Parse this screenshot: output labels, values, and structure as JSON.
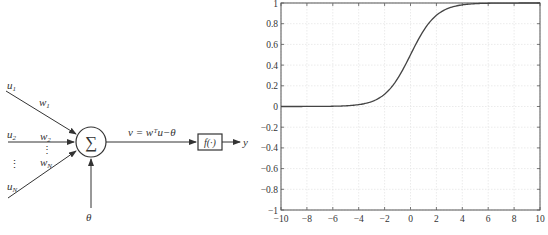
{
  "neuron": {
    "inputs": [
      {
        "label": "u",
        "sub": "1",
        "weight": "w",
        "wsub": "1"
      },
      {
        "label": "u",
        "sub": "2",
        "weight": "w",
        "wsub": "2"
      },
      {
        "label": "u",
        "sub": "N",
        "weight": "w",
        "wsub": "N"
      }
    ],
    "ellipsis": "⋮",
    "sum_symbol": "∑",
    "equation": "v = wᵀu−θ",
    "activation": "f(·)",
    "output": "y",
    "bias": "θ"
  },
  "chart_data": {
    "type": "line",
    "title": "",
    "xlabel": "",
    "ylabel": "",
    "xlim": [
      -10,
      10
    ],
    "ylim": [
      -1,
      1
    ],
    "grid": true,
    "x_ticks": [
      "−10",
      "−8",
      "−6",
      "−4",
      "−2",
      "0",
      "2",
      "4",
      "6",
      "8",
      "10"
    ],
    "y_ticks": [
      "1",
      "0.8",
      "0.6",
      "0.4",
      "0.2",
      "0",
      "−0.2",
      "−0.4",
      "−0.6",
      "−0.8",
      "−1"
    ],
    "series": [
      {
        "name": "sigmoid",
        "function": "1/(1+exp(-x))",
        "x": [
          -10,
          -8,
          -6,
          -4,
          -3,
          -2,
          -1,
          0,
          1,
          2,
          3,
          4,
          6,
          8,
          10
        ],
        "y": [
          0.0,
          0.0003,
          0.0025,
          0.018,
          0.047,
          0.119,
          0.269,
          0.5,
          0.731,
          0.881,
          0.953,
          0.982,
          0.9975,
          0.9997,
          1.0
        ]
      }
    ]
  }
}
